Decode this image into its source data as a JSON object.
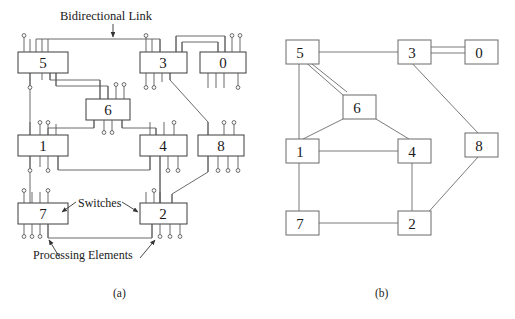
{
  "figure": {
    "annotations": {
      "bidirectional_link": "Bidirectional Link",
      "switches": "Switches",
      "processing_elements": "Processing Elements"
    },
    "captions": {
      "a": "(a)",
      "b": "(b)"
    },
    "colors": {
      "line": "#555555",
      "box_stroke": "#444444",
      "text": "#1a1a1a",
      "background": "#ffffff"
    }
  },
  "panel_a": {
    "caption": "(a)",
    "description": "Switch-level network: each numbered box is a switch with processing-element stubs and bidirectional links",
    "switches": [
      {
        "id": "5",
        "label": "5",
        "x": 18,
        "y": 52,
        "w": 50,
        "h": 21
      },
      {
        "id": "3",
        "label": "3",
        "x": 140,
        "y": 52,
        "w": 47,
        "h": 21
      },
      {
        "id": "0",
        "label": "0",
        "x": 200,
        "y": 52,
        "w": 46,
        "h": 21
      },
      {
        "id": "6",
        "label": "6",
        "x": 86,
        "y": 99,
        "w": 44,
        "h": 21
      },
      {
        "id": "1",
        "label": "1",
        "x": 18,
        "y": 135,
        "w": 50,
        "h": 21
      },
      {
        "id": "4",
        "label": "4",
        "x": 140,
        "y": 135,
        "w": 47,
        "h": 21
      },
      {
        "id": "8",
        "label": "8",
        "x": 198,
        "y": 135,
        "w": 46,
        "h": 21
      },
      {
        "id": "7",
        "label": "7",
        "x": 18,
        "y": 203,
        "w": 50,
        "h": 21
      },
      {
        "id": "2",
        "label": "2",
        "x": 140,
        "y": 203,
        "w": 47,
        "h": 21
      }
    ],
    "link_count": 11,
    "pe_marker": "small-circle"
  },
  "panel_b": {
    "caption": "(b)",
    "description": "Logical graph view of the same topology; double lines denote two parallel links",
    "nodes": [
      {
        "id": "5",
        "label": "5",
        "x": 286,
        "y": 48
      },
      {
        "id": "3",
        "label": "3",
        "x": 398,
        "y": 48
      },
      {
        "id": "0",
        "label": "0",
        "x": 465,
        "y": 48
      },
      {
        "id": "6",
        "label": "6",
        "x": 343,
        "y": 95
      },
      {
        "id": "1",
        "label": "1",
        "x": 286,
        "y": 139
      },
      {
        "id": "4",
        "label": "4",
        "x": 398,
        "y": 139
      },
      {
        "id": "8",
        "label": "8",
        "x": 465,
        "y": 133
      },
      {
        "id": "7",
        "label": "7",
        "x": 286,
        "y": 211
      },
      {
        "id": "2",
        "label": "2",
        "x": 398,
        "y": 211
      }
    ],
    "node_size": {
      "w": 33,
      "h": 24
    },
    "edges": [
      {
        "from": "5",
        "to": "3",
        "multiplicity": 1
      },
      {
        "from": "3",
        "to": "0",
        "multiplicity": 2
      },
      {
        "from": "5",
        "to": "6",
        "multiplicity": 2
      },
      {
        "from": "5",
        "to": "1",
        "multiplicity": 1
      },
      {
        "from": "6",
        "to": "1",
        "multiplicity": 1
      },
      {
        "from": "6",
        "to": "4",
        "multiplicity": 1
      },
      {
        "from": "1",
        "to": "4",
        "multiplicity": 1
      },
      {
        "from": "1",
        "to": "7",
        "multiplicity": 1
      },
      {
        "from": "3",
        "to": "8",
        "multiplicity": 1
      },
      {
        "from": "4",
        "to": "2",
        "multiplicity": 1
      },
      {
        "from": "7",
        "to": "2",
        "multiplicity": 1
      },
      {
        "from": "8",
        "to": "2",
        "multiplicity": 1
      }
    ]
  }
}
